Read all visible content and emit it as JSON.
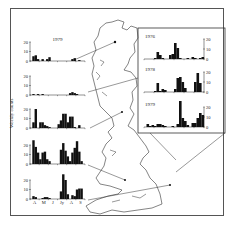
{
  "chart_data": {
    "type": "bar",
    "title": "",
    "ylabel": "Weekly counts",
    "x_tick_labels": [
      "A",
      "M",
      "J",
      "Jy",
      "A",
      "S"
    ],
    "ylim": [
      0,
      20
    ],
    "y_ticks": [
      0,
      10,
      20
    ],
    "legend": [],
    "map": "Great Britain outline with lines linking each panel to a site",
    "left_panels": [
      {
        "label": "1979",
        "values": [
          0,
          5,
          6,
          2,
          0,
          2,
          0,
          2,
          4,
          0,
          0,
          0,
          0,
          0,
          0,
          0,
          0,
          0,
          2,
          3,
          0,
          1,
          0,
          0
        ]
      },
      {
        "label": "",
        "values": [
          0,
          1,
          0,
          1,
          0,
          1,
          0,
          0,
          0,
          0,
          0,
          0,
          0,
          0,
          0,
          0,
          0,
          2,
          3,
          2,
          1,
          0,
          0,
          0
        ]
      },
      {
        "label": "",
        "values": [
          0,
          6,
          20,
          0,
          6,
          6,
          3,
          2,
          1,
          0,
          0,
          0,
          4,
          8,
          15,
          15,
          6,
          12,
          12,
          1,
          0,
          3,
          0,
          0
        ]
      },
      {
        "label": "",
        "values": [
          0,
          25,
          18,
          12,
          5,
          12,
          13,
          5,
          3,
          0,
          0,
          0,
          0,
          15,
          22,
          14,
          8,
          3,
          12,
          17,
          24,
          13,
          3,
          0
        ]
      },
      {
        "label": "",
        "values": [
          0,
          3,
          2,
          0,
          0,
          1,
          2,
          2,
          1,
          0,
          0,
          0,
          0,
          8,
          26,
          20,
          5,
          0,
          4,
          3,
          10,
          11,
          11,
          0
        ]
      }
    ],
    "inset_panels": [
      {
        "label": "1976",
        "values": [
          0,
          0,
          0,
          0,
          1,
          7,
          4,
          1,
          0,
          0,
          4,
          5,
          16,
          11,
          1,
          0,
          0,
          1,
          0,
          2,
          1,
          0,
          1,
          2
        ]
      },
      {
        "label": "1978",
        "values": [
          0,
          0,
          0,
          0,
          1,
          9,
          1,
          3,
          2,
          0,
          0,
          0,
          3,
          14,
          15,
          10,
          4,
          0,
          0,
          0,
          10,
          19,
          9,
          0
        ]
      },
      {
        "label": "1979",
        "values": [
          0,
          3,
          1,
          2,
          1,
          3,
          3,
          2,
          1,
          0,
          0,
          1,
          0,
          3,
          26,
          9,
          6,
          2,
          0,
          4,
          4,
          9,
          14,
          12
        ]
      }
    ]
  },
  "figure": {
    "ylabel": "Weekly counts",
    "year_top_left": "1979",
    "inset_years": [
      "1976",
      "1978",
      "1979"
    ]
  }
}
